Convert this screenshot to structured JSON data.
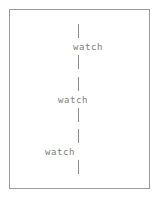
{
  "figure": {
    "type": "vertical-chain-diagram",
    "background_color": "#ffffff",
    "border_color": "#9a9a9a",
    "text_color": "#7d7d7d",
    "tick_color": "#8b8b8b",
    "frame": {
      "x": 9,
      "y": 9,
      "width": 141,
      "height": 180
    },
    "tick_column_x": 78
  },
  "nodes": [
    {
      "label": "watch",
      "x": 73,
      "y": 42,
      "tick_above": {
        "x": 78,
        "y": 24,
        "height": 14
      },
      "tick_below": {
        "x": 78,
        "y": 55,
        "height": 14
      }
    },
    {
      "label": "watch",
      "x": 58,
      "y": 95,
      "tick_above": {
        "x": 78,
        "y": 77,
        "height": 14
      },
      "tick_below": {
        "x": 78,
        "y": 108,
        "height": 14
      }
    },
    {
      "label": "watch",
      "x": 45,
      "y": 147,
      "tick_above": {
        "x": 78,
        "y": 129,
        "height": 14
      },
      "tick_below": {
        "x": 78,
        "y": 160,
        "height": 14
      }
    }
  ]
}
